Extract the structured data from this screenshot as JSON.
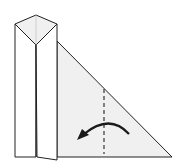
{
  "diagram": {
    "type": "origami-fold-step",
    "colors": {
      "stroke": "#222222",
      "paper": "#f0f0f0",
      "paper_back": "#ffffff",
      "fold_line": "#444444",
      "arrow": "#1a1a1a"
    },
    "elements": {
      "folded_strip": "vertical folded strip with pointed top",
      "triangle_flap": "right triangle flap",
      "valley_fold_line": "dashed vertical fold line",
      "fold_arrow": "curved arrow pointing left"
    }
  }
}
